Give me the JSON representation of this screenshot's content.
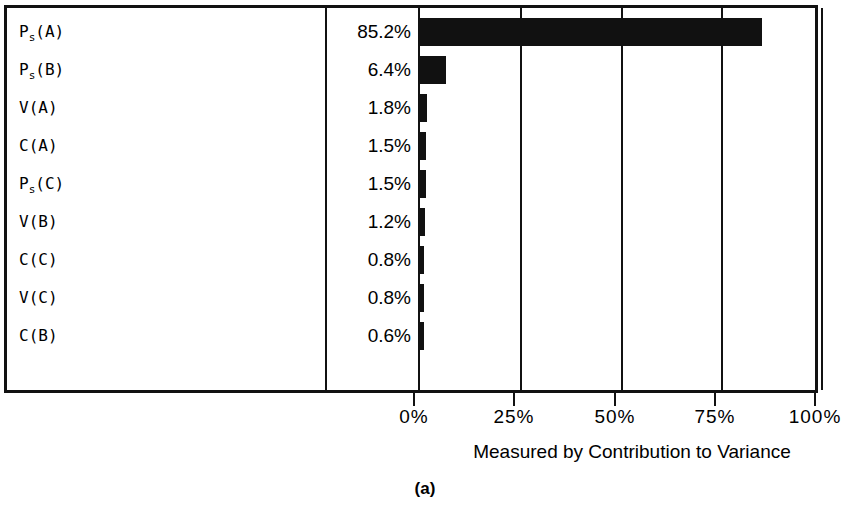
{
  "figure": {
    "caption": "(a)",
    "axis_title": "Measured by Contribution to Variance"
  },
  "axis": {
    "tick_labels": [
      "0%",
      "25%",
      "50%",
      "75%",
      "100%"
    ],
    "tick_values": [
      0,
      25,
      50,
      75,
      100
    ],
    "min": 0,
    "max": 100
  },
  "colors": {
    "bar": "#111111",
    "frame": "#111111",
    "background": "#ffffff",
    "text": "#000000"
  },
  "rows": [
    {
      "label_main": "P",
      "label_sub": "s",
      "label_tail": "(A)",
      "label_plain": "P_s(A)",
      "percent_text": "85.2%",
      "value": 85.2
    },
    {
      "label_main": "P",
      "label_sub": "s",
      "label_tail": "(B)",
      "label_plain": "P_s(B)",
      "percent_text": "6.4%",
      "value": 6.4
    },
    {
      "label_main": "V(A)",
      "label_sub": "",
      "label_tail": "",
      "label_plain": "V(A)",
      "percent_text": "1.8%",
      "value": 1.8
    },
    {
      "label_main": "C(A)",
      "label_sub": "",
      "label_tail": "",
      "label_plain": "C(A)",
      "percent_text": "1.5%",
      "value": 1.5
    },
    {
      "label_main": "P",
      "label_sub": "s",
      "label_tail": "(C)",
      "label_plain": "P_s(C)",
      "percent_text": "1.5%",
      "value": 1.5
    },
    {
      "label_main": "V(B)",
      "label_sub": "",
      "label_tail": "",
      "label_plain": "V(B)",
      "percent_text": "1.2%",
      "value": 1.2
    },
    {
      "label_main": "C(C)",
      "label_sub": "",
      "label_tail": "",
      "label_plain": "C(C)",
      "percent_text": "0.8%",
      "value": 0.8
    },
    {
      "label_main": "V(C)",
      "label_sub": "",
      "label_tail": "",
      "label_plain": "V(C)",
      "percent_text": "0.8%",
      "value": 0.8
    },
    {
      "label_main": "C(B)",
      "label_sub": "",
      "label_tail": "",
      "label_plain": "C(B)",
      "percent_text": "0.6%",
      "value": 0.6
    }
  ],
  "chart_data": {
    "type": "bar",
    "orientation": "horizontal",
    "title": "",
    "subtitle": "",
    "xlabel": "Measured by Contribution to Variance",
    "ylabel": "",
    "categories": [
      "P_s(A)",
      "P_s(B)",
      "V(A)",
      "C(A)",
      "P_s(C)",
      "V(B)",
      "C(C)",
      "V(C)",
      "C(B)"
    ],
    "values": [
      85.2,
      6.4,
      1.8,
      1.5,
      1.5,
      1.2,
      0.8,
      0.8,
      0.6
    ],
    "data_labels": [
      "85.2%",
      "6.4%",
      "1.8%",
      "1.5%",
      "1.5%",
      "1.2%",
      "0.8%",
      "0.8%",
      "0.6%"
    ],
    "xlim": [
      0,
      100
    ],
    "xticks": [
      0,
      25,
      50,
      75,
      100
    ],
    "xtick_labels": [
      "0%",
      "25%",
      "50%",
      "75%",
      "100%"
    ],
    "grid": true,
    "grid_axis": "x",
    "legend": null,
    "caption": "(a)",
    "bar_color": "#111111"
  }
}
